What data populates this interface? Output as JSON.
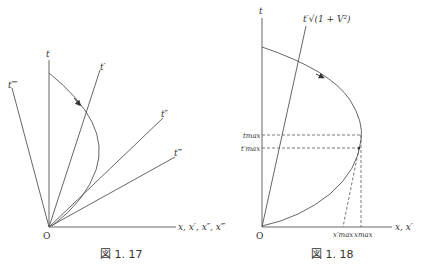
{
  "figures": [
    {
      "caption": "図 1. 17",
      "origin_label": "O",
      "axes": {
        "t": "t",
        "t_prime": "t′",
        "t_double_prime": "t″",
        "t_triple_prime": "t‴",
        "t_quad_prime": "t⁗",
        "x_axis": "x, x′, x″, x‴"
      },
      "curve": "worldline with direction arrow, bulging right and returning to origin"
    },
    {
      "caption": "図 1. 18",
      "origin_label": "O",
      "axes": {
        "t": "t",
        "t_scaled": "t′√(1 + V²)",
        "x_axis": "x, x′"
      },
      "marks": {
        "t_max": "tmax",
        "t_prime_max": "t′max",
        "x_max": "xmax",
        "x_prime_max": "x′max"
      },
      "curve": "worldline with direction arrow, reaching maximum x at tmax"
    }
  ]
}
